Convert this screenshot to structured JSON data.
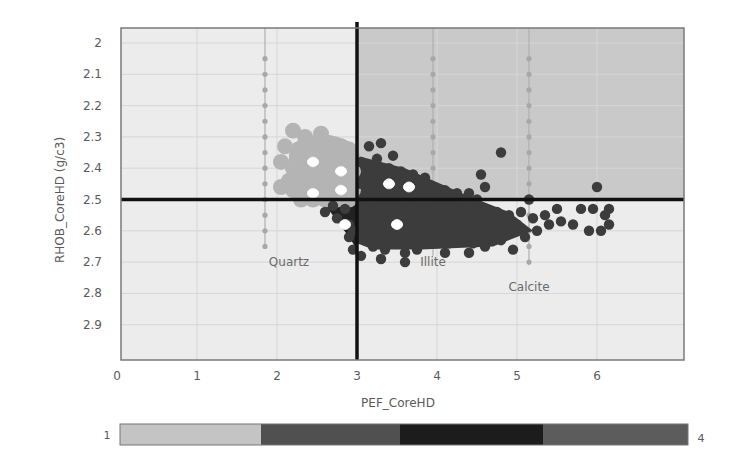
{
  "chart_data": {
    "type": "scatter",
    "title": "",
    "xlabel": "PEF_CoreHD",
    "ylabel": "RHOB_CoreHD (g/c3)",
    "xlim": [
      0,
      7
    ],
    "ylim": [
      3.0,
      1.95
    ],
    "y_inverted": true,
    "x_ticks": [
      0,
      1,
      2,
      3,
      4,
      5,
      6
    ],
    "y_ticks": [
      2,
      2.1,
      2.2,
      2.3,
      2.4,
      2.5,
      2.6,
      2.7,
      2.8,
      2.9
    ],
    "grid": true,
    "cutoffs": {
      "pef_vertical_line": 3.0,
      "rhob_horizontal_line": 2.5
    },
    "quadrant_shading": [
      {
        "region": "PEF<3, RHOB<2.5",
        "color": "#ececec"
      },
      {
        "region": "PEF>3, RHOB<2.5",
        "color": "#c9c9c9"
      },
      {
        "region": "PEF<3, RHOB>2.5",
        "color": "#ececec"
      },
      {
        "region": "PEF>3, RHOB>2.5",
        "color": "#ececec"
      }
    ],
    "mineral_lines": [
      {
        "name": "Quartz",
        "pef": 1.85,
        "rhob_range": [
          2.0,
          2.65
        ],
        "label_pos": [
          2.15,
          2.7
        ]
      },
      {
        "name": "Illite",
        "pef": 3.95,
        "rhob_range": [
          2.0,
          2.68
        ],
        "label_pos": [
          3.95,
          2.7
        ]
      },
      {
        "name": "Calcite",
        "pef": 5.15,
        "rhob_range": [
          2.0,
          2.71
        ],
        "label_pos": [
          5.15,
          2.78
        ]
      }
    ],
    "color_bar": {
      "min_label": "1",
      "max_label": "4",
      "segments": [
        {
          "value": 1,
          "color": "#c4c4c4"
        },
        {
          "value": 2,
          "color": "#505050"
        },
        {
          "value": 3,
          "color": "#1c1c1c"
        },
        {
          "value": 4,
          "color": "#5c5c5c"
        }
      ]
    },
    "series": [
      {
        "name": "Class 1 (light cluster, PEF<3 RHOB<2.5)",
        "color": "#b4b4b4",
        "points": [
          [
            2.35,
            2.3
          ],
          [
            2.5,
            2.32
          ],
          [
            2.6,
            2.32
          ],
          [
            2.7,
            2.33
          ],
          [
            2.8,
            2.33
          ],
          [
            2.9,
            2.34
          ],
          [
            2.25,
            2.36
          ],
          [
            2.4,
            2.35
          ],
          [
            2.55,
            2.35
          ],
          [
            2.7,
            2.36
          ],
          [
            2.85,
            2.37
          ],
          [
            2.95,
            2.37
          ],
          [
            2.2,
            2.4
          ],
          [
            2.35,
            2.4
          ],
          [
            2.5,
            2.4
          ],
          [
            2.65,
            2.4
          ],
          [
            2.8,
            2.4
          ],
          [
            2.95,
            2.41
          ],
          [
            2.15,
            2.44
          ],
          [
            2.3,
            2.44
          ],
          [
            2.45,
            2.43
          ],
          [
            2.6,
            2.43
          ],
          [
            2.75,
            2.44
          ],
          [
            2.9,
            2.44
          ],
          [
            2.2,
            2.47
          ],
          [
            2.35,
            2.47
          ],
          [
            2.5,
            2.47
          ],
          [
            2.65,
            2.47
          ],
          [
            2.8,
            2.47
          ],
          [
            2.95,
            2.47
          ],
          [
            2.3,
            2.5
          ],
          [
            2.45,
            2.5
          ],
          [
            2.6,
            2.5
          ],
          [
            2.75,
            2.5
          ],
          [
            2.9,
            2.5
          ],
          [
            2.05,
            2.38
          ],
          [
            2.1,
            2.33
          ],
          [
            2.05,
            2.46
          ],
          [
            2.55,
            2.29
          ],
          [
            2.2,
            2.28
          ]
        ]
      },
      {
        "name": "Class 2-4 (dark cluster)",
        "color": "#3c3c3c",
        "points": [
          [
            3.15,
            2.33
          ],
          [
            3.3,
            2.32
          ],
          [
            3.45,
            2.36
          ],
          [
            3.25,
            2.37
          ],
          [
            3.05,
            2.38
          ],
          [
            3.4,
            2.4
          ],
          [
            3.15,
            2.41
          ],
          [
            3.3,
            2.42
          ],
          [
            3.55,
            2.41
          ],
          [
            3.7,
            2.42
          ],
          [
            3.85,
            2.43
          ],
          [
            3.05,
            2.45
          ],
          [
            3.2,
            2.45
          ],
          [
            3.5,
            2.46
          ],
          [
            3.65,
            2.47
          ],
          [
            3.8,
            2.47
          ],
          [
            3.95,
            2.46
          ],
          [
            4.1,
            2.47
          ],
          [
            4.25,
            2.48
          ],
          [
            4.4,
            2.48
          ],
          [
            3.1,
            2.49
          ],
          [
            3.3,
            2.49
          ],
          [
            3.5,
            2.49
          ],
          [
            3.7,
            2.5
          ],
          [
            3.9,
            2.5
          ],
          [
            4.15,
            2.51
          ],
          [
            4.5,
            2.5
          ],
          [
            4.8,
            2.35
          ],
          [
            4.55,
            2.42
          ],
          [
            4.6,
            2.46
          ],
          [
            5.15,
            2.5
          ],
          [
            6.0,
            2.46
          ],
          [
            2.7,
            2.52
          ],
          [
            2.85,
            2.53
          ],
          [
            2.6,
            2.54
          ],
          [
            2.75,
            2.56
          ],
          [
            2.9,
            2.58
          ],
          [
            2.95,
            2.6
          ],
          [
            2.9,
            2.62
          ],
          [
            2.95,
            2.66
          ],
          [
            3.1,
            2.52
          ],
          [
            3.25,
            2.53
          ],
          [
            3.4,
            2.52
          ],
          [
            3.55,
            2.53
          ],
          [
            3.7,
            2.52
          ],
          [
            3.85,
            2.53
          ],
          [
            4.0,
            2.52
          ],
          [
            4.15,
            2.53
          ],
          [
            4.3,
            2.53
          ],
          [
            4.45,
            2.54
          ],
          [
            4.6,
            2.53
          ],
          [
            4.75,
            2.54
          ],
          [
            4.9,
            2.55
          ],
          [
            5.05,
            2.54
          ],
          [
            5.2,
            2.56
          ],
          [
            5.35,
            2.55
          ],
          [
            5.5,
            2.53
          ],
          [
            5.4,
            2.58
          ],
          [
            5.55,
            2.57
          ],
          [
            5.25,
            2.6
          ],
          [
            5.1,
            2.62
          ],
          [
            5.0,
            2.58
          ],
          [
            4.85,
            2.6
          ],
          [
            4.7,
            2.58
          ],
          [
            3.15,
            2.56
          ],
          [
            3.3,
            2.57
          ],
          [
            3.45,
            2.56
          ],
          [
            3.6,
            2.58
          ],
          [
            3.75,
            2.57
          ],
          [
            3.9,
            2.58
          ],
          [
            4.05,
            2.57
          ],
          [
            4.2,
            2.58
          ],
          [
            4.35,
            2.59
          ],
          [
            4.5,
            2.6
          ],
          [
            4.65,
            2.62
          ],
          [
            4.8,
            2.63
          ],
          [
            3.1,
            2.6
          ],
          [
            3.25,
            2.61
          ],
          [
            3.4,
            2.62
          ],
          [
            3.55,
            2.61
          ],
          [
            3.7,
            2.63
          ],
          [
            3.85,
            2.62
          ],
          [
            4.0,
            2.63
          ],
          [
            4.15,
            2.64
          ],
          [
            4.3,
            2.63
          ],
          [
            4.45,
            2.64
          ],
          [
            4.6,
            2.65
          ],
          [
            4.95,
            2.66
          ],
          [
            3.2,
            2.65
          ],
          [
            3.35,
            2.66
          ],
          [
            3.6,
            2.67
          ],
          [
            3.75,
            2.66
          ],
          [
            4.1,
            2.67
          ],
          [
            4.4,
            2.67
          ],
          [
            3.05,
            2.68
          ],
          [
            3.3,
            2.69
          ],
          [
            3.6,
            2.7
          ],
          [
            5.8,
            2.53
          ],
          [
            5.95,
            2.53
          ],
          [
            6.1,
            2.55
          ],
          [
            6.15,
            2.53
          ],
          [
            6.05,
            2.6
          ],
          [
            5.9,
            2.6
          ],
          [
            5.7,
            2.58
          ],
          [
            6.15,
            2.58
          ]
        ]
      },
      {
        "name": "Highlighted samples (white)",
        "color": "#ffffff",
        "points": [
          [
            2.45,
            2.38
          ],
          [
            2.8,
            2.41
          ],
          [
            2.45,
            2.48
          ],
          [
            2.8,
            2.47
          ],
          [
            2.85,
            2.58
          ],
          [
            3.4,
            2.45
          ],
          [
            3.65,
            2.46
          ],
          [
            3.5,
            2.58
          ]
        ]
      }
    ]
  }
}
